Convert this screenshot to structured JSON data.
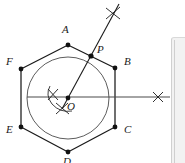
{
  "figure": {
    "stroke_color": "#1a1a1a",
    "line_color": "#3a3a3a",
    "circle_color": "#4a4a4a",
    "panel_color": "#f2f2f2",
    "background": "#ffffff",
    "canvas": {
      "width": 185,
      "height": 163
    }
  },
  "center": {
    "label": "O",
    "x": 68,
    "y": 98
  },
  "circle": {
    "cx": 68,
    "cy": 98,
    "r": 41
  },
  "hexagon": {
    "vertices": [
      {
        "label": "A",
        "x": 68,
        "y": 45,
        "label_x": 62,
        "label_y": 30
      },
      {
        "label": "B",
        "x": 115,
        "y": 68,
        "label_x": 124,
        "label_y": 62
      },
      {
        "label": "C",
        "x": 115,
        "y": 127,
        "label_x": 124,
        "label_y": 128
      },
      {
        "label": "D",
        "x": 68,
        "y": 152,
        "label_x": 63,
        "label_y": 157
      },
      {
        "label": "E",
        "x": 21,
        "y": 127,
        "label_x": 8,
        "label_y": 129
      },
      {
        "label": "F",
        "x": 21,
        "y": 69,
        "label_x": 8,
        "label_y": 62
      }
    ],
    "points_visible": 6
  },
  "point_p": {
    "label": "P",
    "x": 91,
    "y": 56,
    "label_x": 98,
    "label_y": 48
  },
  "rays": [
    {
      "name": "ray-through-p",
      "from_x": 68,
      "from_y": 98,
      "to_x": 119,
      "to_y": 4
    },
    {
      "name": "horizontal-ray",
      "from_x": 27,
      "from_y": 97,
      "to_x": 170,
      "to_y": 97
    }
  ],
  "arc_marks": [
    {
      "name": "arc-mark-upper-right",
      "x": 113,
      "y": 13
    },
    {
      "name": "arc-mark-right",
      "x": 158,
      "y": 97
    },
    {
      "name": "arc-mark-center-left",
      "x": 53,
      "y": 94
    },
    {
      "name": "arc-mark-center-below",
      "x": 62,
      "y": 109
    }
  ],
  "labels": {
    "A": "A",
    "B": "B",
    "C": "C",
    "D": "D",
    "E": "E",
    "F": "F",
    "O": "O",
    "P": "P"
  },
  "side_panel": {
    "name": "side-panel",
    "visible": true
  }
}
